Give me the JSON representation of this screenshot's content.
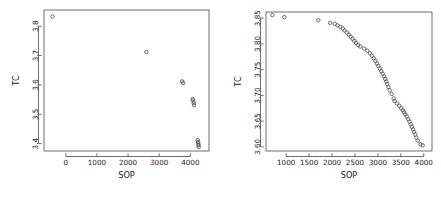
{
  "figure": {
    "background": "#ffffff",
    "point_color": "#555555",
    "axis_color": "#4d4d4d",
    "text_color": "#1a1a1a",
    "panel_count": 2
  },
  "chart_data": [
    {
      "type": "scatter",
      "title": "",
      "xlabel": "SOP",
      "ylabel": "TC",
      "xlim": [
        -700,
        4600
      ],
      "ylim": [
        3.375,
        3.855
      ],
      "xticks": [
        0,
        1000,
        2000,
        3000,
        4000
      ],
      "xticklabels": [
        "0",
        "1000",
        "2000",
        "3000",
        "4000"
      ],
      "yticks": [
        3.4,
        3.5,
        3.6,
        3.7,
        3.8
      ],
      "yticklabels": [
        "3.4",
        "3.5",
        "3.6",
        "3.7",
        "3.8"
      ],
      "grid": false,
      "legend": null,
      "marker": "open-circle",
      "points": [
        {
          "x": -430,
          "y": 3.833
        },
        {
          "x": 2590,
          "y": 3.712
        },
        {
          "x": 3735,
          "y": 3.612
        },
        {
          "x": 3770,
          "y": 3.607
        },
        {
          "x": 4075,
          "y": 3.552
        },
        {
          "x": 4090,
          "y": 3.547
        },
        {
          "x": 4110,
          "y": 3.538
        },
        {
          "x": 4120,
          "y": 3.531
        },
        {
          "x": 4235,
          "y": 3.412
        },
        {
          "x": 4250,
          "y": 3.406
        },
        {
          "x": 4255,
          "y": 3.4
        },
        {
          "x": 4265,
          "y": 3.395
        },
        {
          "x": 4270,
          "y": 3.389
        }
      ]
    },
    {
      "type": "scatter",
      "title": "",
      "xlabel": "SOP",
      "ylabel": "TC",
      "xlim": [
        560,
        4180
      ],
      "ylim": [
        3.592,
        3.862
      ],
      "xticks": [
        1000,
        1500,
        2000,
        2500,
        3000,
        3500,
        4000
      ],
      "xticklabels": [
        "1000",
        "1500",
        "2000",
        "2500",
        "3000",
        "3500",
        "4000"
      ],
      "yticks": [
        3.6,
        3.65,
        3.7,
        3.75,
        3.8,
        3.85
      ],
      "yticklabels": [
        "3.60",
        "3.65",
        "3.70",
        "3.75",
        "3.80",
        "3.85"
      ],
      "grid": false,
      "legend": null,
      "marker": "open-circle",
      "points": [
        {
          "x": 700,
          "y": 3.856
        },
        {
          "x": 960,
          "y": 3.852
        },
        {
          "x": 1700,
          "y": 3.846
        },
        {
          "x": 1960,
          "y": 3.841
        },
        {
          "x": 2060,
          "y": 3.839
        },
        {
          "x": 2120,
          "y": 3.836
        },
        {
          "x": 2180,
          "y": 3.833
        },
        {
          "x": 2235,
          "y": 3.83
        },
        {
          "x": 2275,
          "y": 3.826
        },
        {
          "x": 2320,
          "y": 3.822
        },
        {
          "x": 2365,
          "y": 3.818
        },
        {
          "x": 2405,
          "y": 3.814
        },
        {
          "x": 2445,
          "y": 3.81
        },
        {
          "x": 2485,
          "y": 3.806
        },
        {
          "x": 2525,
          "y": 3.802
        },
        {
          "x": 2570,
          "y": 3.798
        },
        {
          "x": 2615,
          "y": 3.795
        },
        {
          "x": 2700,
          "y": 3.791
        },
        {
          "x": 2770,
          "y": 3.787
        },
        {
          "x": 2825,
          "y": 3.782
        },
        {
          "x": 2870,
          "y": 3.777
        },
        {
          "x": 2910,
          "y": 3.772
        },
        {
          "x": 2945,
          "y": 3.767
        },
        {
          "x": 2980,
          "y": 3.762
        },
        {
          "x": 3010,
          "y": 3.757
        },
        {
          "x": 3045,
          "y": 3.752
        },
        {
          "x": 3075,
          "y": 3.747
        },
        {
          "x": 3105,
          "y": 3.742
        },
        {
          "x": 3135,
          "y": 3.737
        },
        {
          "x": 3160,
          "y": 3.732
        },
        {
          "x": 3185,
          "y": 3.727
        },
        {
          "x": 3205,
          "y": 3.722
        },
        {
          "x": 3230,
          "y": 3.716
        },
        {
          "x": 3255,
          "y": 3.71
        },
        {
          "x": 3300,
          "y": 3.703
        },
        {
          "x": 3345,
          "y": 3.694
        },
        {
          "x": 3365,
          "y": 3.689
        },
        {
          "x": 3420,
          "y": 3.684
        },
        {
          "x": 3465,
          "y": 3.68
        },
        {
          "x": 3510,
          "y": 3.675
        },
        {
          "x": 3545,
          "y": 3.671
        },
        {
          "x": 3570,
          "y": 3.667
        },
        {
          "x": 3600,
          "y": 3.663
        },
        {
          "x": 3630,
          "y": 3.659
        },
        {
          "x": 3660,
          "y": 3.654
        },
        {
          "x": 3690,
          "y": 3.649
        },
        {
          "x": 3715,
          "y": 3.644
        },
        {
          "x": 3740,
          "y": 3.639
        },
        {
          "x": 3765,
          "y": 3.634
        },
        {
          "x": 3790,
          "y": 3.629
        },
        {
          "x": 3815,
          "y": 3.624
        },
        {
          "x": 3840,
          "y": 3.618
        },
        {
          "x": 3870,
          "y": 3.612
        },
        {
          "x": 3930,
          "y": 3.605
        },
        {
          "x": 3975,
          "y": 3.603
        }
      ]
    }
  ]
}
